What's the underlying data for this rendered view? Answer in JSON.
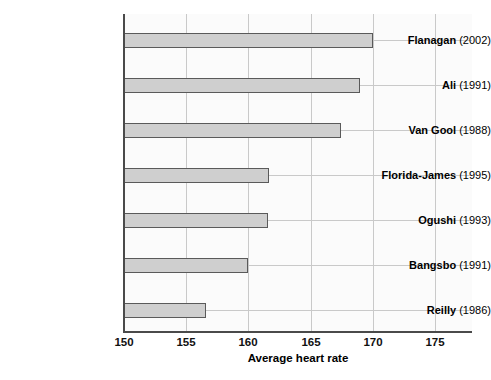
{
  "chart_data": {
    "type": "bar",
    "orientation": "horizontal",
    "title": "",
    "xlabel": "Average heart rate",
    "ylabel": "",
    "xlim": [
      150,
      178
    ],
    "xticks": [
      150,
      155,
      160,
      165,
      170,
      175
    ],
    "grid": "both",
    "legend": "none",
    "categories": [
      "Flanagan (2002)",
      "Ali (1991)",
      "Van Gool (1988)",
      "Florida-James (1995)",
      "Ogushi (1993)",
      "Bangsbo (1991)",
      "Reilly (1986)"
    ],
    "category_parts": [
      {
        "name": "Flanagan",
        "year": "(2002)"
      },
      {
        "name": "Ali",
        "year": "(1991)"
      },
      {
        "name": "Van Gool",
        "year": "(1988)"
      },
      {
        "name": "Florida-James",
        "year": "(1995)"
      },
      {
        "name": "Ogushi",
        "year": "(1993)"
      },
      {
        "name": "Bangsbo",
        "year": "(1991)"
      },
      {
        "name": "Reilly",
        "year": "(1986)"
      }
    ],
    "values": [
      170.1,
      169.0,
      167.5,
      161.7,
      161.6,
      160.0,
      156.6
    ],
    "bar_fill": "#cfcfcf",
    "bar_edge": "#5a5a5a",
    "plot_background": "#fbfbfb",
    "grid_color": "#c9c9c9",
    "axis_color": "#4a4a4a"
  },
  "axis": {
    "x_title": "Average heart rate",
    "ticks": [
      "150",
      "155",
      "160",
      "165",
      "170",
      "175"
    ]
  },
  "caption": {
    "text": ""
  }
}
